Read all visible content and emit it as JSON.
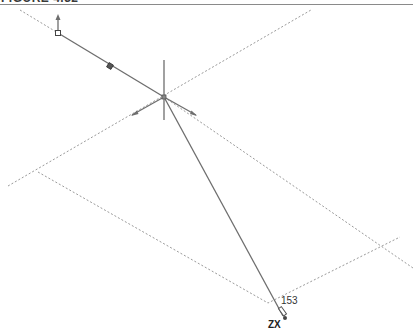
{
  "figure": {
    "caption": "FIGURE 4.32"
  },
  "sketch": {
    "dimension_value": "153",
    "axis_indicator": "ZX"
  },
  "colors": {
    "solid_line": "#6e6e6e",
    "dotted_line": "#9a9a9a",
    "rule": "#8a8a8a",
    "text": "#333333"
  }
}
